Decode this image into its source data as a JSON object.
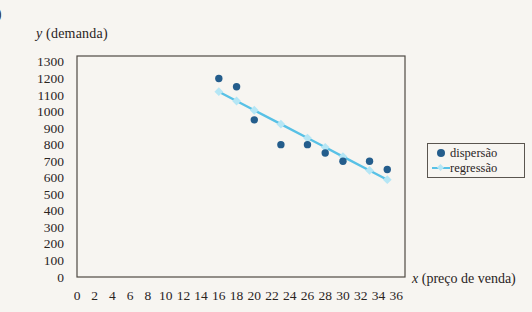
{
  "page": {
    "item_marker": ")"
  },
  "colors": {
    "paper": "#f7f5f1",
    "ink": "#2a241e",
    "frame": "#4f4a44",
    "scatter": "#245d8c",
    "line": "#58c1e6",
    "line_marker": "#b5e6f5",
    "legend_border": "#5a554f"
  },
  "chart_data": {
    "type": "scatter",
    "title": "",
    "ylabel": "y (demanda)",
    "xlabel": "x (preço de venda)",
    "ylabel_parts": {
      "var": "y",
      "rest": " (demanda)"
    },
    "xlabel_parts": {
      "var": "x",
      "rest": " (preço de venda)"
    },
    "xlim": [
      0,
      37
    ],
    "ylim": [
      0,
      1336
    ],
    "x_ticks": [
      0,
      2,
      4,
      6,
      8,
      10,
      12,
      14,
      16,
      18,
      20,
      22,
      24,
      26,
      28,
      30,
      32,
      34,
      36
    ],
    "y_ticks": [
      0,
      100,
      200,
      300,
      400,
      500,
      600,
      700,
      800,
      900,
      1000,
      1100,
      1200,
      1300
    ],
    "grid": false,
    "legend_position": "right-middle",
    "series": [
      {
        "name": "dispersão",
        "type": "scatter",
        "color": "#245d8c",
        "x": [
          16,
          18,
          20,
          23,
          26,
          28,
          30,
          33,
          35
        ],
        "y": [
          1200,
          1150,
          950,
          800,
          800,
          750,
          700,
          700,
          650
        ]
      },
      {
        "name": "regressão",
        "type": "line",
        "color": "#58c1e6",
        "marker": "diamond",
        "marker_color": "#b5e6f5",
        "x": [
          16,
          18,
          20,
          23,
          26,
          28,
          30,
          33,
          35
        ],
        "y": [
          1120,
          1064,
          1008,
          924,
          840,
          784,
          728,
          644,
          588
        ]
      }
    ]
  },
  "legend": {
    "entries": [
      "dispersão",
      "regressão"
    ]
  }
}
